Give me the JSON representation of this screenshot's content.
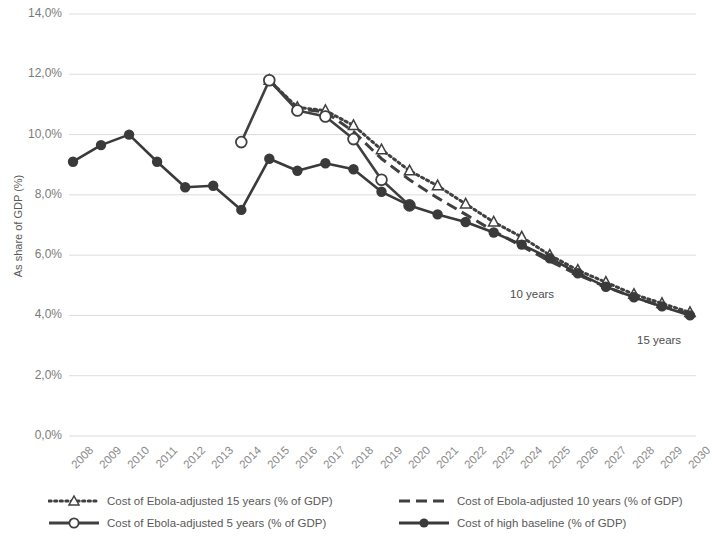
{
  "chart_data": {
    "type": "line",
    "title": "",
    "xlabel": "",
    "ylabel": "As share of GDP (%)",
    "grid": true,
    "legend_position": "bottom",
    "x": [
      2008,
      2009,
      2010,
      2011,
      2012,
      2013,
      2014,
      2015,
      2016,
      2017,
      2018,
      2019,
      2020,
      2021,
      2022,
      2023,
      2024,
      2025,
      2026,
      2027,
      2028,
      2029,
      2030
    ],
    "xtick_labels": [
      "2008",
      "2009",
      "2010",
      "2011",
      "2012",
      "2013",
      "2014",
      "2015",
      "2016",
      "2017",
      "2018",
      "2019",
      "2020",
      "2021",
      "2022",
      "2023",
      "2024",
      "2025",
      "2026",
      "2027",
      "2028",
      "2029",
      "2030"
    ],
    "ytick_labels": [
      "0,0%",
      "2,0%",
      "4,0%",
      "6,0%",
      "8,0%",
      "10,0%",
      "12,0%",
      "14,0%"
    ],
    "ytick_values": [
      0,
      2,
      4,
      6,
      8,
      10,
      12,
      14
    ],
    "ylim": [
      0,
      14
    ],
    "xlim": [
      2008,
      2030
    ],
    "series": [
      {
        "name": "Cost of Ebola-adjusted 15 years (% of GDP)",
        "key": "ebola15",
        "style": "dotted",
        "marker": "triangle-open",
        "color": "#404040",
        "x": [
          2015,
          2016,
          2017,
          2018,
          2019,
          2020,
          2021,
          2022,
          2023,
          2024,
          2025,
          2026,
          2027,
          2028,
          2029,
          2030
        ],
        "values": [
          11.8,
          10.9,
          10.8,
          10.3,
          9.5,
          8.8,
          8.3,
          7.7,
          7.1,
          6.6,
          6.0,
          5.5,
          5.1,
          4.7,
          4.4,
          4.1
        ]
      },
      {
        "name": "Cost of Ebola-adjusted 10 years (% of GDP)",
        "key": "ebola10",
        "style": "dashed",
        "marker": "none",
        "color": "#404040",
        "x": [
          2015,
          2016,
          2017,
          2018,
          2019,
          2020,
          2021,
          2022,
          2023,
          2024,
          2025,
          2026,
          2027,
          2028,
          2029,
          2030
        ],
        "values": [
          11.8,
          10.85,
          10.75,
          10.1,
          9.2,
          8.5,
          7.9,
          7.35,
          6.8,
          6.3,
          5.8,
          5.35,
          4.95,
          4.6,
          4.3,
          4.05
        ]
      },
      {
        "name": "Cost of Ebola-adjusted 5 years (% of GDP)",
        "key": "ebola5",
        "style": "solid",
        "marker": "circle-open",
        "color": "#404040",
        "x": [
          2014,
          2015,
          2016,
          2017,
          2018,
          2019,
          2020
        ],
        "values": [
          9.75,
          11.8,
          10.8,
          10.6,
          9.85,
          8.5,
          7.65
        ]
      },
      {
        "name": "Cost of high baseline (% of GDP)",
        "key": "baseline",
        "style": "solid",
        "marker": "circle-filled",
        "color": "#3a3a3a",
        "x": [
          2008,
          2009,
          2010,
          2011,
          2012,
          2013,
          2014,
          2015,
          2016,
          2017,
          2018,
          2019,
          2020,
          2021,
          2022,
          2023,
          2024,
          2025,
          2026,
          2027,
          2028,
          2029,
          2030
        ],
        "values": [
          9.1,
          9.65,
          10.0,
          9.1,
          8.25,
          8.3,
          7.5,
          9.2,
          8.8,
          9.05,
          8.85,
          8.1,
          7.65,
          7.35,
          7.1,
          6.75,
          6.35,
          5.9,
          5.4,
          4.95,
          4.6,
          4.3,
          4.0
        ]
      }
    ],
    "annotations": [
      {
        "text": "10 years",
        "x": 2025,
        "y": 5.25,
        "px": 510,
        "py": 288
      },
      {
        "text": "15 years",
        "x": 2029,
        "y": 3.4,
        "px": 637,
        "py": 334
      }
    ]
  },
  "axis": {
    "y_title": "As share of GDP (%)"
  },
  "legend": {
    "items": [
      {
        "label": "Cost of Ebola-adjusted 15 years (% of GDP)",
        "key": "ebola15"
      },
      {
        "label": "Cost of Ebola-adjusted 10 years (% of GDP)",
        "key": "ebola10"
      },
      {
        "label": "Cost of Ebola-adjusted 5 years (% of GDP)",
        "key": "ebola5"
      },
      {
        "label": "Cost of high baseline (% of GDP)",
        "key": "baseline"
      }
    ]
  },
  "colors": {
    "grid": "#d9d9d9",
    "tick_text": "#808080",
    "series_dark": "#3a3a3a"
  }
}
